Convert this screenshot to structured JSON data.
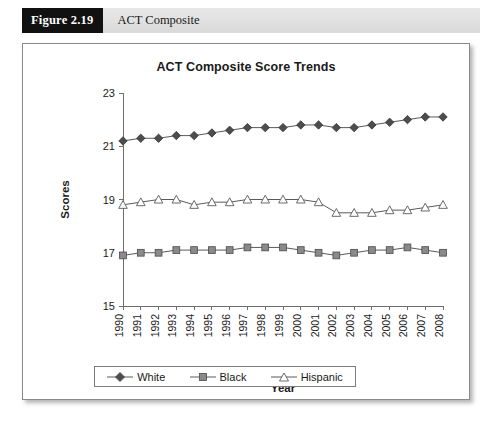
{
  "figure": {
    "number": "Figure 2.19",
    "caption": "ACT Composite"
  },
  "chart_data": {
    "type": "line",
    "title": "ACT Composite Score Trends",
    "xlabel": "Year",
    "ylabel": "Scores",
    "ylim": [
      15,
      23
    ],
    "yticks": [
      15,
      17,
      19,
      21,
      23
    ],
    "grid": false,
    "legend_position": "bottom",
    "categories": [
      "1990",
      "1991",
      "1992",
      "1993",
      "1994",
      "1995",
      "1996",
      "1997",
      "1998",
      "1999",
      "2000",
      "2001",
      "2002",
      "2003",
      "2004",
      "2005",
      "2006",
      "2007",
      "2008"
    ],
    "series": [
      {
        "name": "White",
        "marker": "diamond",
        "color": "#4d4d4d",
        "values": [
          21.2,
          21.3,
          21.3,
          21.4,
          21.4,
          21.5,
          21.6,
          21.7,
          21.7,
          21.7,
          21.8,
          21.8,
          21.7,
          21.7,
          21.8,
          21.9,
          22.0,
          22.1,
          22.1
        ]
      },
      {
        "name": "Black",
        "marker": "square",
        "color": "#8a8a8a",
        "values": [
          16.9,
          17.0,
          17.0,
          17.1,
          17.1,
          17.1,
          17.1,
          17.2,
          17.2,
          17.2,
          17.1,
          17.0,
          16.9,
          17.0,
          17.1,
          17.1,
          17.2,
          17.1,
          17.0
        ]
      },
      {
        "name": "Hispanic",
        "marker": "triangle",
        "color": "#9a9a9a",
        "values": [
          18.8,
          18.9,
          19.0,
          19.0,
          18.8,
          18.9,
          18.9,
          19.0,
          19.0,
          19.0,
          19.0,
          18.9,
          18.5,
          18.5,
          18.5,
          18.6,
          18.6,
          18.7,
          18.8
        ]
      }
    ]
  },
  "legend": {
    "entries": [
      {
        "label": "White"
      },
      {
        "label": "Black"
      },
      {
        "label": "Hispanic"
      }
    ]
  }
}
